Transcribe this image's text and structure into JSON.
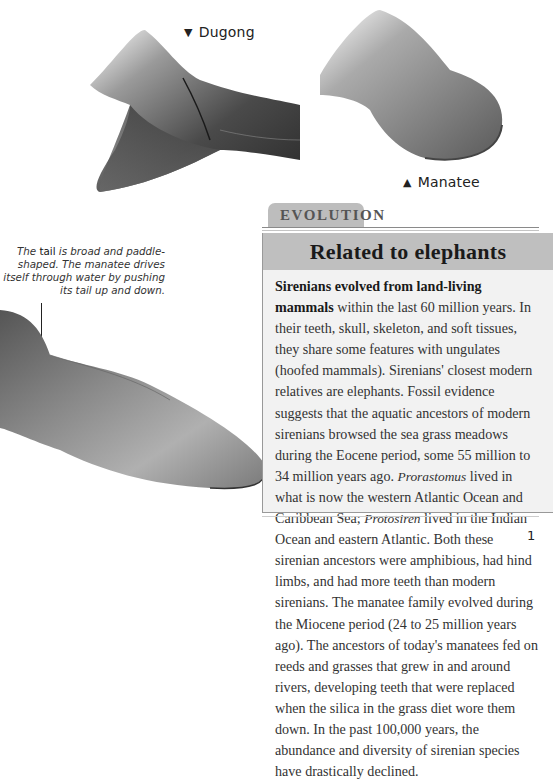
{
  "labels": {
    "dugong": "Dugong",
    "dugong_marker": "▼",
    "manatee": "Manatee",
    "manatee_marker": "▲"
  },
  "annotation": {
    "lead": "The",
    "term": "tail",
    "text": "is broad and paddle-shaped. The manatee drives itself through water by pushing its tail up and down."
  },
  "section": {
    "tab_label": "EVOLUTION",
    "heading": "Related to elephants",
    "body": {
      "bold_lead": "Sirenians evolved from land-living mammals",
      "p1": " within the last 60 million years. In their teeth, skull, skeleton, and soft tissues, they share some features with ungulates (hoofed mammals). Sirenians' closest modern relatives are elephants. Fossil evidence suggests that the aquatic ancestors of modern sirenians browsed the sea grass meadows during the Eocene period, some 55 million to 34 million years ago. ",
      "genus1": "Prorastomus",
      "p2": " lived in what is now the western Atlantic Ocean and Caribbean Sea; ",
      "genus2": "Protosiren",
      "p3": " lived in the Indian Ocean and eastern Atlantic. Both these sirenian ancestors were amphibious, had hind limbs, and had more teeth than modern sirenians. The manatee family evolved during the Miocene period (24 to 25 million years ago). The ancestors of today's manatees fed on reeds and grasses that grew in and around rivers, developing teeth that were replaced when the silica in the grass diet wore them down. In the past 100,000 years, the abundance and diversity of sirenian species have drastically declined."
    }
  },
  "page_number": "1",
  "colors": {
    "tab_bg": "#bdbdbd",
    "heading_bg": "#bfbfbf",
    "box_bg": "#f2f2f2"
  }
}
